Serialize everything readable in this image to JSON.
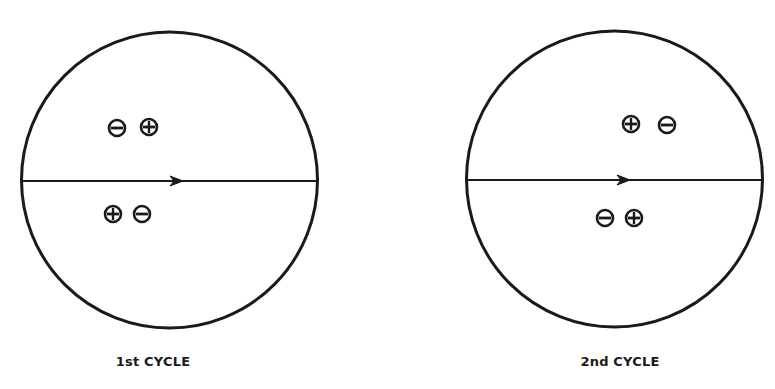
{
  "colors": {
    "ink": "#1a1a1a",
    "background": "#ffffff"
  },
  "panels": [
    {
      "caption": "1st CYCLE",
      "circle": {
        "cx": 169.5,
        "cy": 180,
        "r": 148
      },
      "arrow_x": 180,
      "charges": [
        {
          "sign": "minus",
          "x": 117,
          "y": 128
        },
        {
          "sign": "plus",
          "x": 149,
          "y": 127
        },
        {
          "sign": "plus",
          "x": 113,
          "y": 214
        },
        {
          "sign": "minus",
          "x": 142,
          "y": 214
        }
      ],
      "caption_x": 153
    },
    {
      "caption": "2nd CYCLE",
      "circle": {
        "cx": 614.5,
        "cy": 179,
        "r": 148
      },
      "arrow_x": 627,
      "charges": [
        {
          "sign": "plus",
          "x": 631,
          "y": 124
        },
        {
          "sign": "minus",
          "x": 667,
          "y": 125
        },
        {
          "sign": "minus",
          "x": 605,
          "y": 218
        },
        {
          "sign": "plus",
          "x": 634,
          "y": 218
        }
      ],
      "caption_x": 620
    }
  ]
}
